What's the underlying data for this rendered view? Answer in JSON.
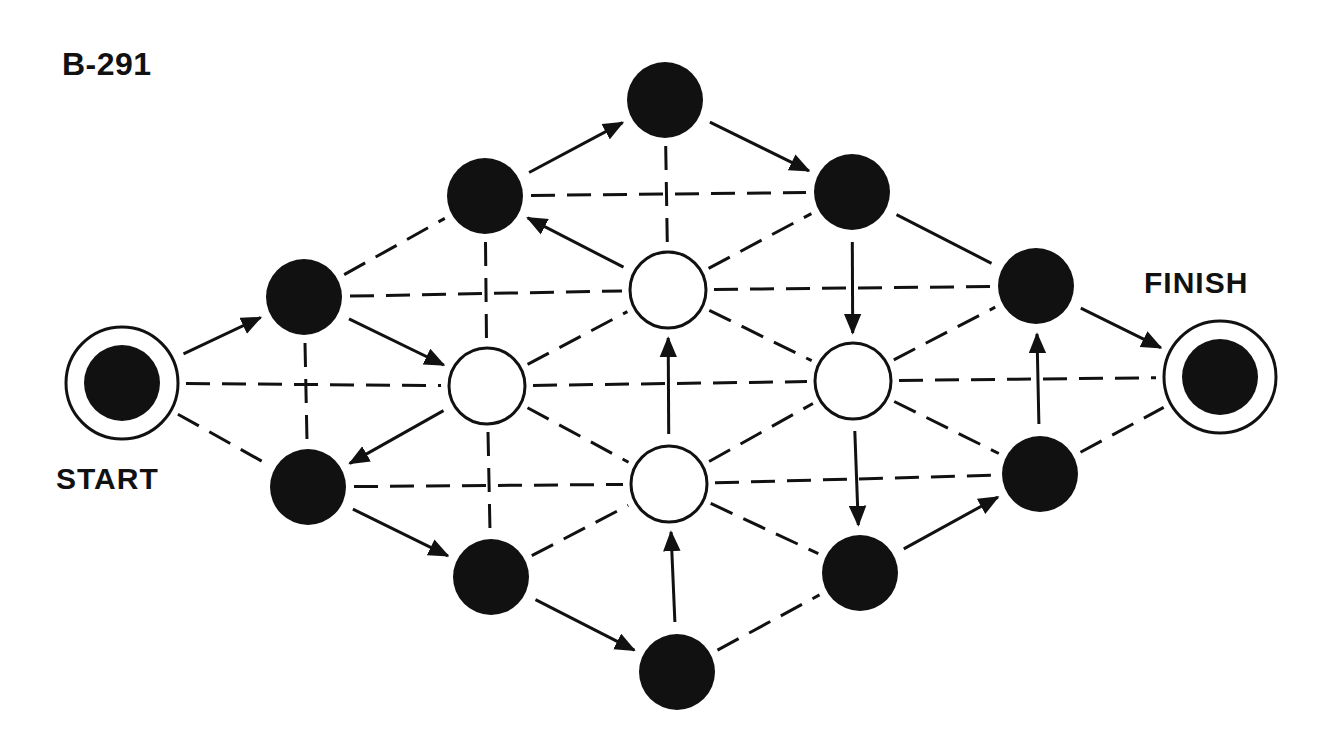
{
  "puzzle": {
    "id": "B-291",
    "start_label": "START",
    "finish_label": "FINISH"
  },
  "style": {
    "ink": "#111111",
    "paper": "#ffffff",
    "node_radius": 38,
    "ring_radius": 56,
    "dash_pattern": "24 12"
  },
  "nodes": [
    {
      "id": "start",
      "x": 122,
      "y": 383,
      "type": "terminal"
    },
    {
      "id": "A",
      "x": 304,
      "y": 297,
      "type": "filled"
    },
    {
      "id": "B",
      "x": 308,
      "y": 487,
      "type": "filled"
    },
    {
      "id": "C",
      "x": 485,
      "y": 196,
      "type": "filled"
    },
    {
      "id": "D",
      "x": 487,
      "y": 386,
      "type": "open"
    },
    {
      "id": "E",
      "x": 491,
      "y": 577,
      "type": "filled"
    },
    {
      "id": "F",
      "x": 665,
      "y": 100,
      "type": "filled"
    },
    {
      "id": "G",
      "x": 668,
      "y": 290,
      "type": "open"
    },
    {
      "id": "H",
      "x": 669,
      "y": 484,
      "type": "open"
    },
    {
      "id": "I",
      "x": 677,
      "y": 672,
      "type": "filled"
    },
    {
      "id": "J",
      "x": 852,
      "y": 192,
      "type": "filled"
    },
    {
      "id": "K",
      "x": 853,
      "y": 381,
      "type": "open"
    },
    {
      "id": "L",
      "x": 860,
      "y": 573,
      "type": "filled"
    },
    {
      "id": "M",
      "x": 1036,
      "y": 286,
      "type": "filled"
    },
    {
      "id": "N",
      "x": 1040,
      "y": 474,
      "type": "filled"
    },
    {
      "id": "finish",
      "x": 1220,
      "y": 377,
      "type": "terminal"
    }
  ],
  "arrows": [
    {
      "from": "start",
      "to": "A"
    },
    {
      "from": "A",
      "to": "D"
    },
    {
      "from": "D",
      "to": "B"
    },
    {
      "from": "B",
      "to": "E"
    },
    {
      "from": "E",
      "to": "I"
    },
    {
      "from": "I",
      "to": "H"
    },
    {
      "from": "H",
      "to": "G"
    },
    {
      "from": "G",
      "to": "C"
    },
    {
      "from": "C",
      "to": "F"
    },
    {
      "from": "F",
      "to": "J"
    },
    {
      "from": "J",
      "to": "K"
    },
    {
      "from": "K",
      "to": "L"
    },
    {
      "from": "L",
      "to": "N"
    },
    {
      "from": "N",
      "to": "M"
    },
    {
      "from": "M",
      "to": "finish"
    }
  ],
  "solid_lines": [
    {
      "from": "J",
      "to": "M"
    }
  ],
  "dashed_lines": [
    {
      "from": "start",
      "to": "D"
    },
    {
      "from": "start",
      "to": "B"
    },
    {
      "from": "A",
      "to": "B"
    },
    {
      "from": "A",
      "to": "C"
    },
    {
      "from": "A",
      "to": "G"
    },
    {
      "from": "C",
      "to": "D"
    },
    {
      "from": "D",
      "to": "E"
    },
    {
      "from": "C",
      "to": "J"
    },
    {
      "from": "F",
      "to": "G"
    },
    {
      "from": "D",
      "to": "G"
    },
    {
      "from": "D",
      "to": "H"
    },
    {
      "from": "D",
      "to": "K"
    },
    {
      "from": "B",
      "to": "H"
    },
    {
      "from": "E",
      "to": "H"
    },
    {
      "from": "G",
      "to": "J"
    },
    {
      "from": "G",
      "to": "K"
    },
    {
      "from": "G",
      "to": "M"
    },
    {
      "from": "H",
      "to": "K"
    },
    {
      "from": "H",
      "to": "L"
    },
    {
      "from": "H",
      "to": "N"
    },
    {
      "from": "K",
      "to": "M"
    },
    {
      "from": "K",
      "to": "N"
    },
    {
      "from": "K",
      "to": "finish"
    },
    {
      "from": "I",
      "to": "L"
    },
    {
      "from": "N",
      "to": "finish"
    }
  ]
}
